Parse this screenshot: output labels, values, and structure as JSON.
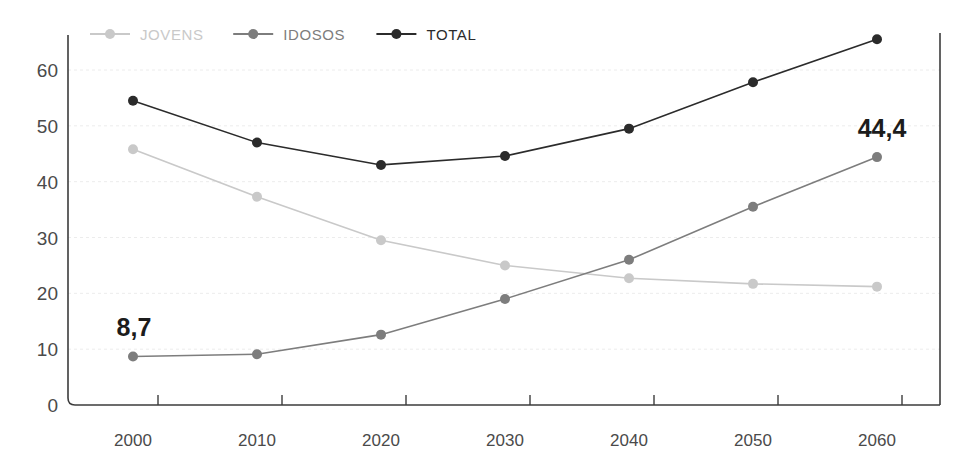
{
  "chart_data": {
    "type": "line",
    "title": "",
    "subtitle": "",
    "xlabel": "",
    "ylabel": "",
    "categories": [
      "2000",
      "2010",
      "2020",
      "2030",
      "2040",
      "2050",
      "2060"
    ],
    "x": [
      2000,
      2010,
      2020,
      2030,
      2040,
      2050,
      2060
    ],
    "ylim": [
      0,
      67
    ],
    "y_ticks": [
      0,
      10,
      20,
      30,
      40,
      50,
      60
    ],
    "y_tick_labels": [
      "0",
      "10",
      "20",
      "30",
      "40",
      "50",
      "60"
    ],
    "grid": true,
    "grid_axis": "y",
    "legend_position": "top-left",
    "series": [
      {
        "name": "JOVENS",
        "color": "#c9c9c9",
        "marker": "circle",
        "values": [
          45.8,
          37.3,
          29.5,
          25.0,
          22.7,
          21.7,
          21.2
        ]
      },
      {
        "name": "IDOSOS",
        "color": "#7d7d7d",
        "marker": "circle",
        "values": [
          8.7,
          9.1,
          12.6,
          19.0,
          26.0,
          35.5,
          44.4
        ]
      },
      {
        "name": "TOTAL",
        "color": "#2b2b2b",
        "marker": "circle",
        "values": [
          54.5,
          47.0,
          43.0,
          44.6,
          49.5,
          57.8,
          65.5
        ]
      }
    ],
    "annotations": [
      {
        "text": "8,7",
        "series": "IDOSOS",
        "category": "2000",
        "value": 8.7
      },
      {
        "text": "44,4",
        "series": "IDOSOS",
        "category": "2060",
        "value": 44.4
      }
    ]
  },
  "legend": {
    "items": [
      {
        "label": "JOVENS",
        "color": "#c9c9c9"
      },
      {
        "label": "IDOSOS",
        "color": "#7d7d7d"
      },
      {
        "label": "TOTAL",
        "color": "#2b2b2b"
      }
    ]
  },
  "axes": {
    "y_labels": [
      "60",
      "50",
      "40",
      "30",
      "20",
      "10",
      "0"
    ],
    "x_labels": [
      "2000",
      "2010",
      "2020",
      "2030",
      "2040",
      "2050",
      "2060"
    ]
  },
  "colors": {
    "jovens": "#c9c9c9",
    "idosos": "#7d7d7d",
    "total": "#2b2b2b",
    "axis": "#3c3c3c",
    "grid": "#ececec",
    "annotation": "#1c1c1c",
    "background": "#ffffff"
  }
}
